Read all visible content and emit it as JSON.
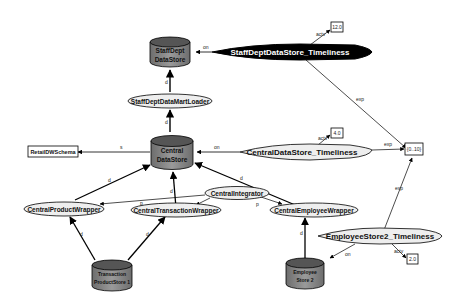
{
  "diagram": {
    "colors": {
      "datastore_fill": "#8a8a8a",
      "datastore_top": "#5e5e5e",
      "ellipse_fill": "#eeeeee",
      "black_ellipse": "#000000",
      "edge": "#000000",
      "background": "#ffffff"
    },
    "datastores": [
      {
        "id": "staffdept",
        "line1": "StaffDept",
        "line2": "DataStore"
      },
      {
        "id": "central",
        "line1": "Central",
        "line2": "DataStore"
      },
      {
        "id": "product",
        "line1": "Transaction",
        "line2": "ProductStore 1"
      },
      {
        "id": "employee",
        "line1": "Employee",
        "line2": "Store 2"
      }
    ],
    "processes": [
      {
        "id": "staffdept_loader",
        "label": "StaffDeptDataMartLoader"
      },
      {
        "id": "product_wrapper",
        "label": "CentralProductWrapper"
      },
      {
        "id": "transaction_wrapper",
        "label": "CentralTransactionWrapper"
      },
      {
        "id": "integrator",
        "label": "CentralIntegrator"
      },
      {
        "id": "employee_wrapper",
        "label": "CentralEmployeeWrapper"
      }
    ],
    "quality_factors": [
      {
        "id": "staffdept_timeliness",
        "label": "StaffDeptDataStore_Timeliness",
        "style": "filled-black"
      },
      {
        "id": "central_timeliness",
        "label": "CentralDataStore_Timeliness",
        "style": "outline"
      },
      {
        "id": "employee_timeliness",
        "label": "EmployeeStore2_Timeliness",
        "style": "outline"
      }
    ],
    "schema": {
      "id": "retail_schema",
      "label": "RetailDWSchema"
    },
    "value_boxes": [
      {
        "id": "val_staffdept",
        "label": "12.0",
        "edge_label": "actv"
      },
      {
        "id": "val_central",
        "label": "4.0",
        "edge_label": "actv"
      },
      {
        "id": "val_employee",
        "label": "2.0",
        "edge_label": "actv"
      },
      {
        "id": "val_expected",
        "label": "{0..10}"
      }
    ],
    "edge_labels": {
      "on": "on",
      "s": "s",
      "d": "d",
      "p": "p",
      "exp": "exp",
      "actv": "actv"
    }
  }
}
